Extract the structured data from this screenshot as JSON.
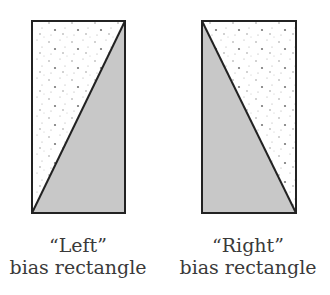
{
  "colors": {
    "shade": "#c8c8c8",
    "stroke": "#222222",
    "paper": "#ffffff",
    "dots": "#888888"
  },
  "panels": [
    {
      "id": "left",
      "title": "“Left”",
      "subtitle": "bias rectangle",
      "shaded_region": "lower-right triangle",
      "diagonal": "bottom-left to top-right"
    },
    {
      "id": "right",
      "title": "“Right”",
      "subtitle": "bias rectangle",
      "shaded_region": "lower-left triangle",
      "diagonal": "top-left to bottom-right"
    }
  ]
}
